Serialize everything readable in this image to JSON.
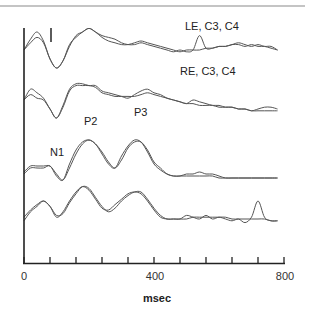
{
  "chart_data": {
    "type": "line",
    "title": "",
    "xlabel": "msec",
    "ylabel": "",
    "xlim": [
      0,
      800
    ],
    "x_ticks": [
      0,
      80,
      160,
      240,
      320,
      400,
      480,
      560,
      640,
      720,
      800
    ],
    "x_tick_labels": [
      "0",
      "400",
      "800"
    ],
    "grid": false,
    "legend": "none",
    "scale_bar": "vertical calibration bar near top-left (~80 ms)",
    "annotations": [
      {
        "text": "LE, C3, C4",
        "trace": 0
      },
      {
        "text": "RE, C3, C4",
        "trace": 1
      },
      {
        "text": "N1",
        "trace": 2,
        "x": 90
      },
      {
        "text": "P2",
        "trace": 2,
        "x": 200
      },
      {
        "text": "P3",
        "trace": 2,
        "x": 350
      }
    ],
    "series": [
      {
        "name": "LE C3",
        "group": 0,
        "x": [
          0,
          20,
          40,
          60,
          80,
          100,
          120,
          140,
          160,
          180,
          200,
          220,
          240,
          260,
          280,
          300,
          320,
          340,
          360,
          380,
          400,
          420,
          440,
          460,
          480,
          500,
          520,
          540,
          560,
          580,
          600,
          620,
          640,
          660,
          680,
          700,
          720,
          740,
          760,
          780
        ],
        "y": [
          0,
          0.6,
          1.0,
          0.5,
          -0.5,
          -1.0,
          -0.6,
          0.2,
          0.8,
          1.0,
          1.2,
          1.0,
          0.8,
          0.7,
          0.6,
          0.4,
          0.3,
          0.3,
          0.4,
          0.3,
          0.2,
          0.1,
          0.0,
          -0.1,
          0.0,
          -0.1,
          0.0,
          0.8,
          0.1,
          0.1,
          0.2,
          0.2,
          0.3,
          0.3,
          0.2,
          0.3,
          0.2,
          0.2,
          0.1,
          0.0
        ]
      },
      {
        "name": "LE C4",
        "group": 0,
        "x": [
          0,
          20,
          40,
          60,
          80,
          100,
          120,
          140,
          160,
          180,
          200,
          220,
          240,
          260,
          280,
          300,
          320,
          340,
          360,
          380,
          400,
          420,
          440,
          460,
          480,
          500,
          520,
          540,
          560,
          580,
          600,
          620,
          640,
          660,
          680,
          700,
          720,
          740,
          760,
          780
        ],
        "y": [
          0,
          0.4,
          0.7,
          0.4,
          -0.5,
          -1.0,
          -0.6,
          0.3,
          0.7,
          1.0,
          1.2,
          1.0,
          0.7,
          0.5,
          0.4,
          0.3,
          0.3,
          0.4,
          0.5,
          0.4,
          0.3,
          0.2,
          0.1,
          0.0,
          -0.1,
          0.0,
          0.0,
          0.0,
          0.1,
          0.1,
          0.2,
          0.2,
          0.3,
          0.4,
          0.3,
          0.2,
          0.3,
          0.2,
          0.2,
          0.0
        ]
      },
      {
        "name": "RE C3",
        "group": 1,
        "x": [
          0,
          20,
          40,
          60,
          80,
          100,
          120,
          140,
          160,
          180,
          200,
          220,
          240,
          260,
          280,
          300,
          320,
          340,
          360,
          380,
          400,
          420,
          440,
          460,
          480,
          500,
          520,
          540,
          560,
          580,
          600,
          620,
          640,
          660,
          680,
          700,
          720,
          740,
          760,
          780
        ],
        "y": [
          0,
          0.6,
          0.4,
          0.1,
          -0.5,
          -1.0,
          -0.3,
          0.6,
          0.9,
          0.9,
          0.8,
          0.8,
          0.5,
          0.4,
          0.3,
          0.2,
          0.1,
          0.3,
          0.5,
          0.6,
          0.4,
          0.3,
          0.1,
          0.0,
          -0.1,
          -0.2,
          0.0,
          -0.1,
          -0.2,
          -0.3,
          -0.3,
          -0.4,
          -0.4,
          -0.5,
          -0.5,
          -0.6,
          -0.5,
          -0.4,
          -0.4,
          -0.5
        ]
      },
      {
        "name": "RE C4",
        "group": 1,
        "x": [
          0,
          20,
          40,
          60,
          80,
          100,
          120,
          140,
          160,
          180,
          200,
          220,
          240,
          260,
          280,
          300,
          320,
          340,
          360,
          380,
          400,
          420,
          440,
          460,
          480,
          500,
          520,
          540,
          560,
          580,
          600,
          620,
          640,
          660,
          680,
          700,
          720,
          740,
          760,
          780
        ],
        "y": [
          0,
          0.3,
          0.1,
          0.0,
          -0.5,
          -1.0,
          -0.4,
          0.5,
          0.8,
          0.8,
          0.8,
          0.7,
          0.4,
          0.3,
          0.2,
          0.2,
          0.2,
          0.2,
          0.3,
          0.4,
          0.3,
          0.2,
          0.1,
          0.0,
          -0.1,
          -0.2,
          -0.2,
          -0.3,
          -0.3,
          -0.3,
          -0.4,
          -0.4,
          -0.4,
          -0.5,
          -0.5,
          -0.6,
          -0.6,
          -0.6,
          -0.6,
          -0.6
        ]
      },
      {
        "name": "Trace 3a",
        "group": 2,
        "x": [
          0,
          20,
          40,
          60,
          80,
          100,
          120,
          140,
          160,
          180,
          200,
          220,
          240,
          260,
          280,
          300,
          320,
          340,
          360,
          380,
          400,
          420,
          440,
          460,
          480,
          500,
          520,
          540,
          560,
          580,
          600,
          620,
          640,
          660,
          680,
          700,
          720,
          740,
          760,
          780
        ],
        "y": [
          -0.3,
          0.0,
          0.0,
          0.0,
          0.1,
          -0.4,
          -0.6,
          0.2,
          0.9,
          1.3,
          1.4,
          1.2,
          0.7,
          0.2,
          0.0,
          0.6,
          1.1,
          1.4,
          1.3,
          0.8,
          0.2,
          -0.1,
          -0.3,
          -0.4,
          -0.4,
          -0.3,
          -0.3,
          -0.2,
          -0.3,
          -0.3,
          -0.4,
          -0.5,
          -0.5,
          -0.5,
          -0.5,
          -0.5,
          -0.5,
          -0.5,
          -0.5,
          -0.5
        ]
      },
      {
        "name": "Trace 3b",
        "group": 2,
        "x": [
          0,
          20,
          40,
          60,
          80,
          100,
          120,
          140,
          160,
          180,
          200,
          220,
          240,
          260,
          280,
          300,
          320,
          340,
          360,
          380,
          400,
          420,
          440,
          460,
          480,
          500,
          520,
          540,
          560,
          580,
          600,
          620,
          640,
          660,
          680,
          700,
          720,
          740,
          760,
          780
        ],
        "y": [
          -0.2,
          0.1,
          0.1,
          0.1,
          0.1,
          -0.3,
          -0.6,
          0.0,
          0.7,
          1.2,
          1.4,
          1.2,
          0.8,
          0.3,
          0.0,
          0.4,
          1.0,
          1.3,
          1.3,
          0.9,
          0.3,
          0.0,
          -0.3,
          -0.4,
          -0.4,
          -0.4,
          -0.4,
          -0.4,
          -0.4,
          -0.4,
          -0.5,
          -0.5,
          -0.5,
          -0.5,
          -0.5,
          -0.5,
          -0.5,
          -0.5,
          -0.5,
          -0.5
        ]
      },
      {
        "name": "Trace 4a",
        "group": 3,
        "x": [
          0,
          20,
          40,
          60,
          80,
          100,
          120,
          140,
          160,
          180,
          200,
          220,
          240,
          260,
          280,
          300,
          320,
          340,
          360,
          380,
          400,
          420,
          440,
          460,
          480,
          500,
          520,
          540,
          560,
          580,
          600,
          620,
          640,
          660,
          680,
          700,
          720,
          740,
          760,
          780
        ],
        "y": [
          -0.4,
          0.0,
          0.3,
          0.5,
          0.2,
          -0.4,
          -0.1,
          0.5,
          1.0,
          1.3,
          1.1,
          0.6,
          0.1,
          0.0,
          0.3,
          0.6,
          0.9,
          1.0,
          0.9,
          0.5,
          0.0,
          -0.4,
          -0.5,
          -0.5,
          -0.5,
          -0.3,
          -0.4,
          -0.5,
          -0.3,
          -0.5,
          -0.4,
          -0.5,
          -0.6,
          -0.5,
          -0.7,
          -0.4,
          0.5,
          -0.4,
          -0.6,
          -0.6
        ]
      },
      {
        "name": "Trace 4b",
        "group": 3,
        "x": [
          0,
          20,
          40,
          60,
          80,
          100,
          120,
          140,
          160,
          180,
          200,
          220,
          240,
          260,
          280,
          300,
          320,
          340,
          360,
          380,
          400,
          420,
          440,
          460,
          480,
          500,
          520,
          540,
          560,
          580,
          600,
          620,
          640,
          660,
          680,
          700,
          720,
          740,
          760,
          780
        ],
        "y": [
          -0.6,
          -0.1,
          0.2,
          0.5,
          0.2,
          -0.3,
          -0.2,
          0.4,
          0.9,
          1.3,
          1.2,
          0.7,
          0.2,
          -0.1,
          0.1,
          0.5,
          0.8,
          1.0,
          1.0,
          0.6,
          0.1,
          -0.3,
          -0.5,
          -0.5,
          -0.5,
          -0.5,
          -0.4,
          -0.4,
          -0.4,
          -0.4,
          -0.4,
          -0.4,
          -0.5,
          -0.5,
          -0.5,
          -0.5,
          -0.5,
          -0.5,
          -0.6,
          -0.6
        ]
      }
    ]
  },
  "labels": {
    "trace1": "LE, C3, C4",
    "trace2": "RE, C3, C4",
    "n1": "N1",
    "p2": "P2",
    "p3": "P3",
    "tick0": "0",
    "tick400": "400",
    "tick800": "800",
    "xlabel": "msec"
  },
  "layout": {
    "plot_left": 24,
    "plot_right": 284,
    "axis_y": 263,
    "axis_top": 28,
    "baselines": [
      50,
      100,
      168,
      210
    ],
    "amp_scale": [
      18,
      18,
      20,
      18
    ],
    "line_color": "#555555",
    "axis_color": "#222222",
    "rule_color": "#777777"
  }
}
